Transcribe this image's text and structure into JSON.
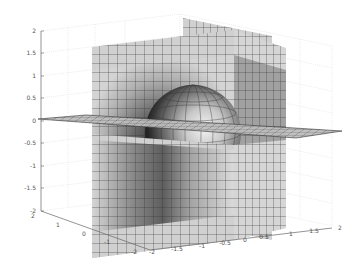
{
  "chart_data": {
    "type": "surface3d",
    "title": "",
    "xlabel": "",
    "ylabel": "",
    "zlabel": "",
    "x_ticks": [
      "-2",
      "-1.5",
      "-1",
      "-0.5",
      "0",
      "0.5",
      "1",
      "1.5",
      "2"
    ],
    "y_ticks": [
      "-2",
      "-1",
      "0",
      "1",
      "2"
    ],
    "z_ticks": [
      "2",
      "1.5",
      "1",
      "0.5",
      "0",
      "-0.5",
      "-1",
      "-1.5",
      "-2"
    ],
    "xlim": [
      -2,
      2
    ],
    "ylim": [
      -2,
      2
    ],
    "zlim": [
      -2,
      2
    ],
    "grid": true,
    "colormap": "gray",
    "objects": [
      {
        "name": "sphere",
        "center": [
          0,
          0,
          0
        ],
        "radius": 1
      },
      {
        "name": "plane-x",
        "normal": "x",
        "position": 0,
        "extent": [
          -1,
          1
        ]
      },
      {
        "name": "plane-y",
        "normal": "y",
        "position": 0,
        "extent": [
          -1,
          1
        ]
      },
      {
        "name": "plane-z",
        "normal": "z",
        "position": 0,
        "extent": [
          -2,
          2
        ]
      }
    ]
  },
  "axes": {
    "z_labels": [
      {
        "text": "2",
        "y": 31
      },
      {
        "text": "1.5",
        "y": 53
      },
      {
        "text": "1",
        "y": 76
      },
      {
        "text": "0.5",
        "y": 98
      },
      {
        "text": "0",
        "y": 121
      },
      {
        "text": "-0.5",
        "y": 143
      },
      {
        "text": "-1",
        "y": 166
      },
      {
        "text": "-1.5",
        "y": 188
      },
      {
        "text": "-2",
        "y": 211
      }
    ],
    "y_labels": [
      {
        "text": "2",
        "x": 33,
        "y": 218
      },
      {
        "text": "1",
        "x": 58,
        "y": 227
      },
      {
        "text": "0",
        "x": 84,
        "y": 236
      },
      {
        "text": "-1",
        "x": 107,
        "y": 244
      },
      {
        "text": "-2",
        "x": 134,
        "y": 254
      }
    ],
    "x_labels": [
      {
        "text": "-2",
        "x": 152,
        "y": 254
      },
      {
        "text": "-1.5",
        "x": 177,
        "y": 251
      },
      {
        "text": "-1",
        "x": 202,
        "y": 248
      },
      {
        "text": "-0.5",
        "x": 225,
        "y": 245
      },
      {
        "text": "0",
        "x": 245,
        "y": 242
      },
      {
        "text": "0.5",
        "x": 264,
        "y": 239
      },
      {
        "text": "1",
        "x": 291,
        "y": 236
      },
      {
        "text": "1.5",
        "x": 314,
        "y": 233
      },
      {
        "text": "2",
        "x": 340,
        "y": 230
      }
    ]
  }
}
